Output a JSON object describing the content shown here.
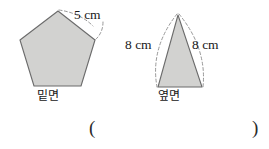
{
  "figure": {
    "type": "geometry-diagram",
    "shapes": [
      {
        "name": "pentagon-base",
        "kind": "regular-pentagon",
        "caption": "밑면",
        "fill_color": "#d2d2d0",
        "stroke_color": "#6b6b6b",
        "labeled_edge": {
          "text": "5 cm",
          "value": 5,
          "unit": "cm",
          "leader": "dashed-arc"
        }
      },
      {
        "name": "triangle-lateral-face",
        "kind": "isosceles-triangle",
        "caption": "옆면",
        "fill_color": "#d2d2d0",
        "stroke_color": "#6b6b6b",
        "labeled_edges": [
          {
            "text": "8 cm",
            "value": 8,
            "unit": "cm",
            "side": "left",
            "leader": "dashed-arc"
          },
          {
            "text": "8 cm",
            "value": 8,
            "unit": "cm",
            "side": "right",
            "leader": "dashed-arc"
          }
        ]
      }
    ],
    "answer_blank": {
      "open_paren": "(",
      "close_paren": ")",
      "value": ""
    }
  }
}
